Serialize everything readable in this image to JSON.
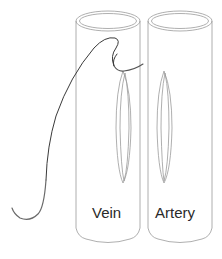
{
  "diagram": {
    "labels": {
      "vein": "Vein",
      "artery": "Artery"
    },
    "colors": {
      "outline": "#9a9a9a",
      "suture": "#3a3a3a",
      "text": "#2a2a2a",
      "background": "#ffffff"
    }
  }
}
